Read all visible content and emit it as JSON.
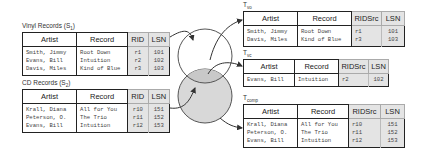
{
  "sources": [
    {
      "label": "Vinyl Records (S",
      "sub": "1",
      "label_end": ")",
      "headers": [
        "Artist",
        "Record",
        "RID",
        "LSN"
      ],
      "rows": [
        [
          "Smith, Jimmy",
          "Root Down",
          "r1",
          "101"
        ],
        [
          "Evans, Bill",
          "Intuition",
          "r2",
          "102"
        ],
        [
          "Davis, Miles",
          "Kind of Blue",
          "r3",
          "103"
        ]
      ]
    },
    {
      "label": "CD Records (S",
      "sub": "2",
      "label_end": ")",
      "headers": [
        "Artist",
        "Record",
        "RID",
        "LSN"
      ],
      "rows": [
        [
          "Krall, Diana",
          "All for You",
          "r10",
          "151"
        ],
        [
          "Peterson, O.",
          "The Trio",
          "r11",
          "152"
        ],
        [
          "Evans, Bill",
          "Intuition",
          "r12",
          "153"
        ]
      ]
    }
  ],
  "targets": [
    {
      "label": "T",
      "sub": "vo",
      "headers": [
        "Artist",
        "Record",
        "RIDSrc",
        "LSN"
      ],
      "rows": [
        [
          "Smith, Jimmy",
          "Root Down",
          "r1",
          "101"
        ],
        [
          "Davis, Miles",
          "Kind of Blue",
          "r3",
          "103"
        ]
      ]
    },
    {
      "label": "T",
      "sub": "vc",
      "headers": [
        "Artist",
        "Record",
        "RIDSrc",
        "LSN"
      ],
      "rows": [
        [
          "Evans, Bill",
          "Intuition",
          "r2",
          "102"
        ]
      ]
    },
    {
      "label": "T",
      "sub": "comp",
      "headers": [
        "Artist",
        "Record",
        "RIDSrc",
        "LSN"
      ],
      "rows": [
        [
          "Krall, Diana",
          "All for You",
          "r10",
          "151"
        ],
        [
          "Peterson, O.",
          "The Trio",
          "r11",
          "152"
        ],
        [
          "Evans, Bill",
          "Intuition",
          "r12",
          "153"
        ]
      ]
    }
  ],
  "colors": {
    "circle_fill": "#d8d8d8",
    "cell_gray": "#e4e4e4",
    "line": "#333333"
  }
}
